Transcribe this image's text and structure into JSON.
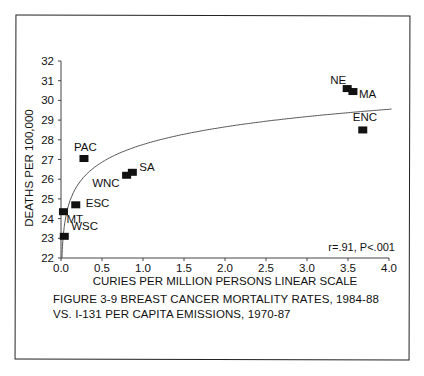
{
  "chart_data": {
    "type": "scatter",
    "xlabel": "CURIES PER MILLION PERSONS LINEAR SCALE",
    "ylabel": "DEATHS PER 100,000",
    "xlim": [
      0.0,
      4.0
    ],
    "ylim": [
      22,
      32
    ],
    "x_ticks": [
      "0.0",
      "0.5",
      "1.0",
      "1.5",
      "2.0",
      "2.5",
      "3.0",
      "3.5",
      "4.0"
    ],
    "y_ticks": [
      "22",
      "23",
      "24",
      "25",
      "26",
      "27",
      "28",
      "29",
      "30",
      "31",
      "32"
    ],
    "grid": false,
    "legend": null,
    "annotation": "r=.91, P<.001",
    "points": [
      {
        "label": "NE",
        "x": 3.49,
        "y": 30.6
      },
      {
        "label": "MA",
        "x": 3.56,
        "y": 30.45
      },
      {
        "label": "ENC",
        "x": 3.68,
        "y": 28.5
      },
      {
        "label": "PAC",
        "x": 0.28,
        "y": 27.05
      },
      {
        "label": "SA",
        "x": 0.87,
        "y": 26.35
      },
      {
        "label": "WNC",
        "x": 0.8,
        "y": 26.2
      },
      {
        "label": "ESC",
        "x": 0.18,
        "y": 24.7
      },
      {
        "label": "MT",
        "x": 0.03,
        "y": 24.35
      },
      {
        "label": "WSC",
        "x": 0.04,
        "y": 23.1
      }
    ],
    "fit_curve": {
      "type": "logarithmic",
      "a": 27.76,
      "b": 1.29,
      "x_range": [
        0.01,
        4.05
      ]
    }
  },
  "caption": {
    "line1": "FIGURE 3-9  BREAST CANCER MORTALITY RATES, 1984-88",
    "line2": "VS. I-131 PER CAPITA EMISSIONS, 1970-87"
  },
  "colors": {
    "ink": "#111111",
    "curve": "#555555",
    "background": "#ffffff"
  }
}
